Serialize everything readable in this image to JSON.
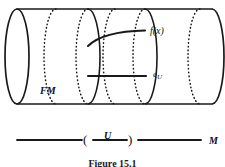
{
  "figure": {
    "caption": "Figure 15.1"
  },
  "diagram": {
    "type": "mathematical-illustration",
    "shape": "cylinder",
    "stroke_color": "#1a1a1a",
    "background_color": "#ffffff",
    "labels": {
      "bundle_total_space": "FM",
      "section_point": "f(x)",
      "identity_section": "e",
      "identity_section_subscript": "U",
      "open_set": "U",
      "base_manifold": "M",
      "paren_open": "(",
      "paren_close": ")"
    },
    "cylinder": {
      "left_end_x": 17,
      "right_end_x": 212,
      "top_y": 9,
      "bottom_y": 104,
      "ellipse_rx": 12,
      "ellipse_ry": 48,
      "center_y": 56
    },
    "fiber_ellipses_x": [
      17,
      88,
      115,
      145,
      200,
      212
    ],
    "curve_fx": {
      "from_x": 88,
      "from_y": 45,
      "to_x": 145,
      "to_y": 31
    },
    "line_eu": {
      "from_x": 88,
      "from_y": 76,
      "to_x": 146,
      "to_y": 76
    },
    "base_line": {
      "y": 140,
      "left_segment": [
        17,
        82
      ],
      "middle_segment": [
        93,
        127
      ],
      "right_segment": [
        138,
        201
      ]
    }
  }
}
